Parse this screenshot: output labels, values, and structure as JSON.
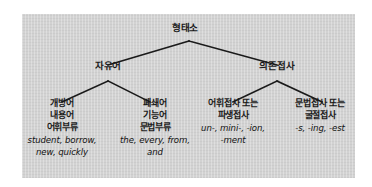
{
  "figure": {
    "panel_color": "#d2d2d2",
    "line_color": "#1a1a1a",
    "background_color": "#ffffff"
  },
  "tree": {
    "root": {
      "label": "형태소"
    },
    "level2": [
      {
        "label": "자유어"
      },
      {
        "label": "의존접사"
      }
    ],
    "leaves": [
      {
        "ko_lines": [
          "개방어",
          "내용어",
          "어휘부류"
        ],
        "examples": [
          "student, borrow,",
          "new, quickly"
        ]
      },
      {
        "ko_lines": [
          "폐쇄어",
          "기능어",
          "문법부류"
        ],
        "examples": [
          "the, every, from,",
          "and"
        ]
      },
      {
        "ko_lines": [
          "어휘접사 또는",
          "파생접사"
        ],
        "examples": [
          "un-, mini-, -ion,",
          "-ment"
        ]
      },
      {
        "ko_lines": [
          "문법접사 또는",
          "굴절접사"
        ],
        "examples": [
          "-s, -ing, -est"
        ]
      }
    ]
  }
}
